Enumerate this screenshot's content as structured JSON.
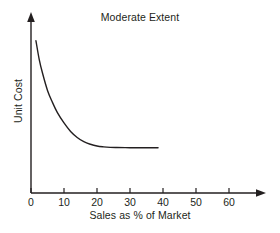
{
  "chart_data": {
    "type": "line",
    "title": "Moderate Extent",
    "xlabel": "Sales as % of Market",
    "ylabel": "Unit Cost",
    "xlim": [
      0,
      70
    ],
    "ylim": [
      0,
      100
    ],
    "xticks": [
      0,
      10,
      20,
      30,
      40,
      50,
      60
    ],
    "xtick_labels": [
      "0",
      "10",
      "20",
      "30",
      "40",
      "50",
      "60"
    ],
    "yticks": [],
    "ytick_labels": [],
    "grid": false,
    "legend": false,
    "axis_arrows": true,
    "line_color": "#231f20",
    "background_color": "#ffffff",
    "series": [
      {
        "name": "Unit cost experience curve",
        "x": [
          1.5,
          2.5,
          3.5,
          5,
          6.5,
          8,
          10,
          12,
          14,
          16,
          18,
          20,
          22,
          24,
          26,
          30,
          34,
          38.5
        ],
        "y": [
          89,
          78,
          70,
          60,
          53,
          47,
          41,
          36,
          32.5,
          30,
          28.5,
          27.5,
          27,
          26.7,
          26.6,
          26.5,
          26.5,
          26.5
        ]
      }
    ],
    "annotations": []
  },
  "axes": {
    "y_arrow_name": "y-axis-arrow",
    "x_arrow_name": "x-axis-arrow"
  }
}
